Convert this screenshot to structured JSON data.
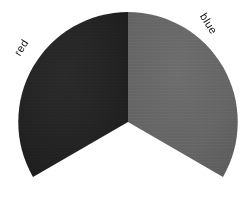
{
  "chart_data": {
    "type": "pie",
    "title": "",
    "categories": [
      "red",
      "blue"
    ],
    "values": [
      33.3,
      33.3
    ],
    "labels": [
      "red",
      "blue"
    ],
    "colors": [
      "#242424",
      "#666666"
    ],
    "background": "#ffffff",
    "legend": "none",
    "geometry": {
      "center_x": 128,
      "center_y": 122,
      "radius": 110,
      "slices": [
        {
          "name": "red",
          "start_angle_deg": 90,
          "end_angle_deg": 210,
          "sweep_deg": 120,
          "color": "#242424"
        },
        {
          "name": "blue",
          "start_angle_deg": 330,
          "end_angle_deg": 90,
          "sweep_deg": 120,
          "color": "#666666"
        }
      ]
    }
  },
  "labels": {
    "red": {
      "text": "red",
      "x": 22,
      "y": 48,
      "rotation": -58,
      "color": "#111111"
    },
    "blue": {
      "text": "blue",
      "x": 208,
      "y": 24,
      "rotation": 58,
      "color": "#111111"
    }
  },
  "slices": {
    "red": {
      "name": "red-slice",
      "path": "M 128 122 L 128 12 A 110 110 0 0 0 33 177 Z",
      "fill": "#242424"
    },
    "blue": {
      "name": "blue-slice",
      "path": "M 128 122 L 128 12 A 110 110 0 0 1 223 177 Z",
      "fill": "#666666"
    }
  }
}
